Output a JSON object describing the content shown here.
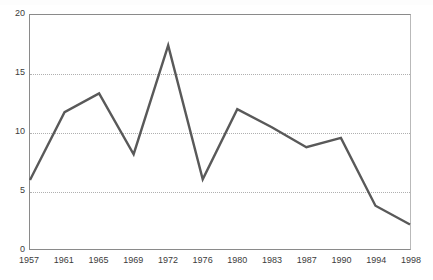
{
  "chart_data": {
    "type": "line",
    "title": "",
    "subtitle": "",
    "xlabel": "",
    "ylabel": "",
    "categories": [
      "1957",
      "1961",
      "1965",
      "1969",
      "1972",
      "1976",
      "1980",
      "1983",
      "1987",
      "1990",
      "1994",
      "1998"
    ],
    "x": [
      1957,
      1961,
      1965,
      1969,
      1972,
      1976,
      1980,
      1983,
      1987,
      1990,
      1994,
      1998
    ],
    "values": [
      5.9,
      11.7,
      13.3,
      8.1,
      17.4,
      5.95,
      11.95,
      10.4,
      8.7,
      9.5,
      3.7,
      2.1
    ],
    "series": [
      {
        "name": "series-1",
        "values": [
          5.9,
          11.7,
          13.3,
          8.1,
          17.4,
          5.95,
          11.95,
          10.4,
          8.7,
          9.5,
          3.7,
          2.1
        ],
        "color": "#595959"
      }
    ],
    "ylim": [
      0,
      20
    ],
    "yticks": [
      0,
      5,
      10,
      15,
      20
    ],
    "ytick_labels": [
      "0",
      "5",
      "10",
      "15",
      "20"
    ],
    "xtick_labels": [
      "1957",
      "1961",
      "1965",
      "1969",
      "1972",
      "1976",
      "1980",
      "1983",
      "1987",
      "1990",
      "1994",
      "1998"
    ],
    "grid": {
      "horizontal": true,
      "vertical": false,
      "style": "dotted",
      "color": "#b0b0b0",
      "at_values": [
        5,
        10,
        15
      ]
    },
    "legend": {
      "visible": false,
      "position": "none",
      "entries": []
    },
    "axis_color": "#8a8a8a",
    "line_color": "#595959",
    "line_width": 2.4,
    "markers": false,
    "background": "#ffffff"
  }
}
